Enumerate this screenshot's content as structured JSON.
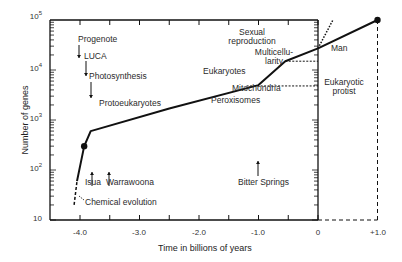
{
  "chart_data": {
    "type": "line",
    "title": "",
    "xlabel": "Time in billions of years",
    "ylabel": "Number of genes",
    "xlim": [
      -4.5,
      1.0
    ],
    "ylim_log10": [
      1,
      5
    ],
    "yscale": "log",
    "grid": false,
    "x_ticks": [
      -4.0,
      -3.5,
      -3.0,
      -2.5,
      -2.0,
      -1.5,
      -1.0,
      -0.5,
      0,
      1.0
    ],
    "x_tick_labels": [
      "-4.0",
      "-3.0",
      "-2.0",
      "-1.0",
      "0",
      "+1.0"
    ],
    "y_tick_labels": [
      "10",
      "10^2",
      "10^3",
      "10^4",
      "10^5"
    ],
    "series": [
      {
        "name": "gene count (speculative early phase)",
        "style": "dashed",
        "points": [
          [
            -4.1,
            20
          ],
          [
            -4.05,
            60
          ]
        ]
      },
      {
        "name": "gene count",
        "style": "solid",
        "points": [
          [
            -4.05,
            60
          ],
          [
            -3.93,
            300
          ],
          [
            -3.82,
            600
          ],
          [
            -2.5,
            1700
          ],
          [
            -1.0,
            5000
          ],
          [
            -0.55,
            15000
          ],
          [
            0,
            27000
          ],
          [
            1.0,
            100000
          ]
        ]
      },
      {
        "name": "accelerated extrapolation",
        "style": "dotted",
        "points": [
          [
            0,
            27000
          ],
          [
            0.25,
            100000
          ]
        ]
      }
    ],
    "markers": [
      {
        "x": -3.93,
        "y": 300
      },
      {
        "x": 1.0,
        "y": 100000
      }
    ],
    "reference_lines": [
      {
        "name": "eukaryotic-protist-level",
        "style": "dashed",
        "from": [
          -1.2,
          4800
        ],
        "to": [
          0,
          4800
        ]
      },
      {
        "name": "multicellularity-level",
        "style": "dashed",
        "from": [
          -0.55,
          15000
        ],
        "to": [
          0,
          15000
        ]
      },
      {
        "name": "future-vertical",
        "style": "dashed",
        "from": [
          1.0,
          100000
        ],
        "to": [
          1.0,
          10
        ]
      },
      {
        "name": "future-baseline",
        "style": "dashed",
        "from": [
          0,
          10
        ],
        "to": [
          1.0,
          10
        ]
      }
    ],
    "annotations": [
      {
        "text": "Progenote",
        "arrow": "down"
      },
      {
        "text": "LUCA",
        "arrow": "down"
      },
      {
        "text": "Photosynthesis",
        "arrow": "down"
      },
      {
        "text": "Protoeukaryotes"
      },
      {
        "text": "Isua",
        "arrow": "up"
      },
      {
        "text": "Warrawoona",
        "arrow": "up"
      },
      {
        "text": "Chemical evolution"
      },
      {
        "text": "Bitter Springs",
        "arrow": "up"
      },
      {
        "text": "Eukaryotes"
      },
      {
        "text": "Mitochondria"
      },
      {
        "text": "Peroxisomes"
      },
      {
        "text": "Sexual reproduction"
      },
      {
        "text": "Multicellularity"
      },
      {
        "text": "Man"
      },
      {
        "text": "Eukaryotic protist"
      }
    ]
  },
  "labels": {
    "progenote": "Progenote",
    "luca": "LUCA",
    "photosynthesis": "Photosynthesis",
    "protoeukaryotes": "Protoeukaryotes",
    "isua": "Isua",
    "warrawoona": "Warrawoona",
    "chemical_evolution": "Chemical evolution",
    "bitter_springs": "Bitter Springs",
    "eukaryotes": "Eukaryotes",
    "mitochondria": "Mitochondria",
    "peroxisomes": "Peroxisomes",
    "sexual_1": "Sexual",
    "sexual_2": "reproduction",
    "multi_1": "Multicellu-",
    "multi_2": "larity",
    "man": "Man",
    "protist_1": "Eukaryotic",
    "protist_2": "protist"
  },
  "axes": {
    "xlabel": "Time in billions of years",
    "ylabel": "Number of genes",
    "x_tick_labels": {
      "m4": "-4.0",
      "m3": "-3.0",
      "m2": "-2.0",
      "m1": "-1.0",
      "zero": "0",
      "p1": "+1.0"
    },
    "y_tick_labels": {
      "e1": "10",
      "e2_base": "10",
      "e2_exp": "2",
      "e3_base": "10",
      "e3_exp": "3",
      "e4_base": "10",
      "e4_exp": "4",
      "e5_base": "10",
      "e5_exp": "5"
    }
  },
  "colors": {
    "line": "#111111",
    "text": "#2a2a2a",
    "background": "#ffffff"
  }
}
